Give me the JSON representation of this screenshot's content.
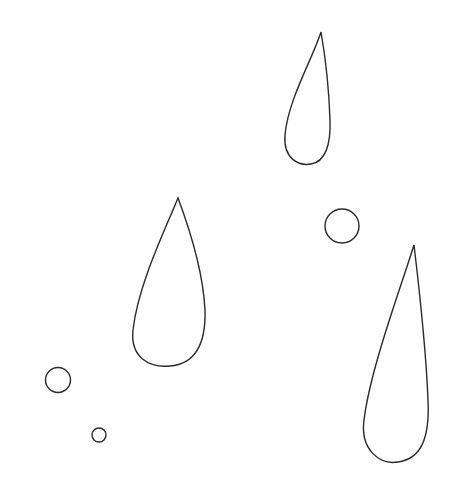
{
  "canvas": {
    "width": 455,
    "height": 500,
    "background": "#ffffff",
    "stroke": "#2a2a2a",
    "stroke_width": 1.4
  },
  "drops": [
    {
      "name": "raindrop-upper-right",
      "path": "M321,32 C312,60 288,100 285,135 C283,160 300,166 311,164 C325,162 331,145 330,120 C329,90 325,55 321,32 Z"
    },
    {
      "name": "raindrop-middle-left",
      "path": "M178,198 C165,230 138,285 133,330 C130,358 150,368 170,366 C195,364 206,345 205,310 C203,270 190,230 178,198 Z"
    },
    {
      "name": "raindrop-lower-right",
      "path": "M414,245 C400,290 370,370 364,420 C360,450 380,465 398,462 C420,459 430,440 428,400 C426,350 420,295 414,245 Z"
    }
  ],
  "bubbles": [
    {
      "name": "bubble-right",
      "cx": 342,
      "cy": 226,
      "r": 17
    },
    {
      "name": "bubble-left",
      "cx": 58,
      "cy": 380,
      "r": 12.5
    },
    {
      "name": "bubble-tiny",
      "cx": 99,
      "cy": 435,
      "r": 7
    }
  ]
}
